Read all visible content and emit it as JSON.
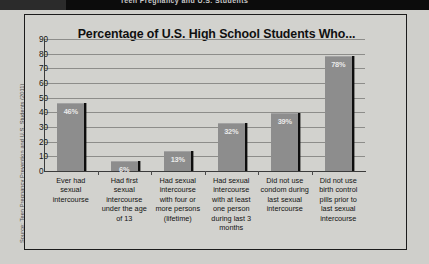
{
  "window": {
    "titlebar_text": "Teen Pregnancy and U.S. Students"
  },
  "source_credit": "Source: Teen Pregnancy Prevention and U.S. Students (2011)",
  "chart_data": {
    "type": "bar",
    "title": "Percentage of U.S. High School Students Who...",
    "xlabel": "",
    "ylabel": "",
    "ylim": [
      0,
      90
    ],
    "yticks": [
      90,
      80,
      70,
      60,
      50,
      40,
      30,
      20,
      10,
      0
    ],
    "grid": true,
    "legend": "none",
    "categories": [
      "Ever had sexual intercourse",
      "Had first sexual intercourse under the age of 13",
      "Had sexual intercourse with four or more persons (lifetime)",
      "Had sexual intercourse with at least one person during last 3 months",
      "Did not use condom during last sexual intercourse",
      "Did not use birth control pills prior to last sexual intercourse"
    ],
    "category_lines": [
      [
        "Ever had",
        "sexual",
        "intercourse"
      ],
      [
        "Had first",
        "sexual",
        "intercourse",
        "under the age",
        "of 13"
      ],
      [
        "Had sexual",
        "intercourse",
        "with four or",
        "more persons",
        "(lifetime)"
      ],
      [
        "Had sexual",
        "intercourse",
        "with at least",
        "one person",
        "during last 3",
        "months"
      ],
      [
        "Did not use",
        "condom during",
        "last sexual",
        "intercourse"
      ],
      [
        "Did not use",
        "birth control",
        "pills prior to",
        "last sexual",
        "intercourse"
      ]
    ],
    "values": [
      46,
      6,
      13,
      32,
      39,
      78
    ],
    "value_labels": [
      "46%",
      "6%",
      "13%",
      "32%",
      "39%",
      "78%"
    ],
    "bar_color": "#8d8d8d",
    "shadow_color": "#0d0d0d",
    "background_color": "#d2d2ce"
  }
}
